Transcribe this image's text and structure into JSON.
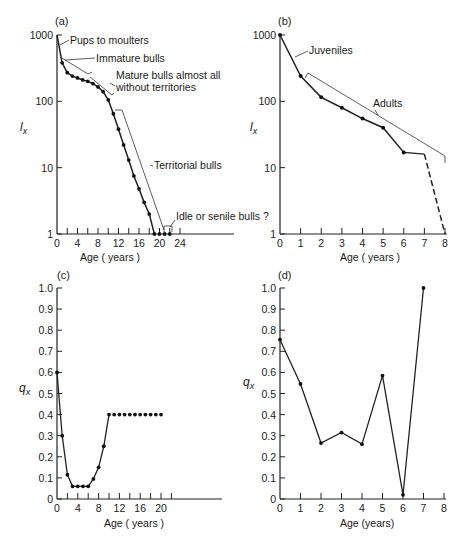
{
  "chart_data": [
    {
      "panel": "(a)",
      "type": "line",
      "yscale": "log",
      "xlabel": "Age ( years )",
      "ylabel": "l_x",
      "xticks": [
        0,
        4,
        8,
        12,
        16,
        20,
        24
      ],
      "yticks": [
        1,
        10,
        100,
        1000
      ],
      "xlim": [
        0,
        24
      ],
      "ylim": [
        1,
        1000
      ],
      "series": [
        {
          "name": "l_x",
          "x": [
            0,
            1,
            2,
            3,
            4,
            5,
            6,
            7,
            8,
            9,
            10,
            11,
            12,
            13,
            14,
            15,
            16,
            17,
            18,
            19,
            20,
            21,
            22
          ],
          "values": [
            1000,
            380,
            270,
            240,
            225,
            210,
            200,
            185,
            165,
            140,
            105,
            65,
            38,
            22,
            13,
            7.5,
            4.8,
            3,
            2,
            1,
            1,
            1,
            1
          ]
        }
      ],
      "annotations": [
        "Pups to moulters",
        "Immature bulls",
        "Mature bulls almost all without territories",
        "Territorial bulls",
        "Idle or senile bulls ?"
      ]
    },
    {
      "panel": "(b)",
      "type": "line",
      "yscale": "log",
      "xlabel": "Age ( years )",
      "ylabel": "l_x",
      "xticks": [
        0,
        1,
        2,
        3,
        4,
        5,
        6,
        7,
        8
      ],
      "yticks": [
        1,
        10,
        100,
        1000
      ],
      "xlim": [
        0,
        8
      ],
      "ylim": [
        1,
        1000
      ],
      "series": [
        {
          "name": "l_x",
          "x": [
            0,
            1,
            2,
            3,
            4,
            5,
            6,
            7,
            8
          ],
          "values": [
            1000,
            240,
            115,
            80,
            55,
            40,
            17,
            16,
            1
          ]
        }
      ],
      "annotations": [
        "Juveniles",
        "Adults"
      ]
    },
    {
      "panel": "(c)",
      "type": "line",
      "xlabel": "Age ( years )",
      "ylabel": "q_x",
      "xticks": [
        0,
        4,
        8,
        12,
        16,
        20
      ],
      "yticks": [
        0,
        0.1,
        0.2,
        0.3,
        0.4,
        0.5,
        0.6,
        0.7,
        0.8,
        0.9,
        1.0
      ],
      "xlim": [
        0,
        20
      ],
      "ylim": [
        0,
        1.0
      ],
      "series": [
        {
          "name": "q_x",
          "x": [
            0,
            1,
            2,
            3,
            4,
            5,
            6,
            7,
            8,
            9,
            10,
            11,
            12,
            13,
            14,
            15,
            16,
            17,
            18,
            19,
            20
          ],
          "values": [
            0.6,
            0.3,
            0.115,
            0.06,
            0.06,
            0.06,
            0.06,
            0.095,
            0.15,
            0.25,
            0.4,
            0.4,
            0.4,
            0.4,
            0.4,
            0.4,
            0.4,
            0.4,
            0.4,
            0.4,
            0.4
          ]
        }
      ]
    },
    {
      "panel": "(d)",
      "type": "line",
      "xlabel": "Age (years)",
      "ylabel": "q_x",
      "xticks": [
        0,
        1,
        2,
        3,
        4,
        5,
        6,
        7,
        8
      ],
      "yticks": [
        0,
        0.1,
        0.2,
        0.3,
        0.4,
        0.5,
        0.6,
        0.7,
        0.8,
        0.9,
        1.0
      ],
      "xlim": [
        0,
        8
      ],
      "ylim": [
        0,
        1.0
      ],
      "series": [
        {
          "name": "q_x",
          "x": [
            0,
            1,
            2,
            3,
            4,
            5,
            6,
            7
          ],
          "values": [
            0.755,
            0.545,
            0.265,
            0.315,
            0.26,
            0.585,
            0.02,
            1.0
          ]
        }
      ]
    }
  ],
  "labels": {
    "a": "(a)",
    "b": "(b)",
    "c": "(c)",
    "d": "(d)",
    "age_years": "Age ( years )",
    "age_years_d": "Age (years)",
    "lx": "l",
    "lx_sub": "x",
    "qx": "q",
    "qx_sub": "x",
    "ann_pups": "Pups to moulters",
    "ann_immature": "Immature bulls",
    "ann_mature1": "Mature bulls almost all",
    "ann_mature2": "without territories",
    "ann_territorial": "Territorial bulls",
    "ann_idle": "Idle or senile bulls ?",
    "ann_juveniles": "Juveniles",
    "ann_adults": "Adults"
  }
}
